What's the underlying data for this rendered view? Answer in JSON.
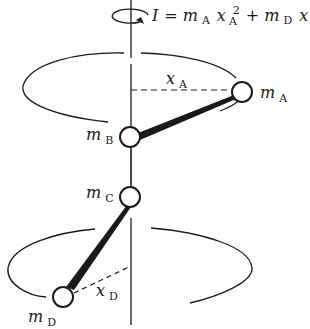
{
  "diagram": {
    "formula": {
      "lhs": "I",
      "equals": "=",
      "term1_mass": "m",
      "term1_mass_sub": "A",
      "term1_dist": "x",
      "term1_dist_sub": "A",
      "term1_power": "2",
      "plus": "+",
      "term2_mass": "m",
      "term2_mass_sub": "D",
      "term2_dist": "x",
      "term2_dist_sub": "D",
      "term2_power": "2"
    },
    "masses": [
      {
        "id": "A",
        "symbol": "m",
        "sub": "A"
      },
      {
        "id": "B",
        "symbol": "m",
        "sub": "B"
      },
      {
        "id": "C",
        "symbol": "m",
        "sub": "C"
      },
      {
        "id": "D",
        "symbol": "m",
        "sub": "D"
      }
    ],
    "distances": [
      {
        "id": "xA",
        "symbol": "x",
        "sub": "A"
      },
      {
        "id": "xD",
        "symbol": "x",
        "sub": "D"
      }
    ],
    "colors": {
      "ink": "#1a1a1a",
      "background": "#ffffff"
    }
  }
}
